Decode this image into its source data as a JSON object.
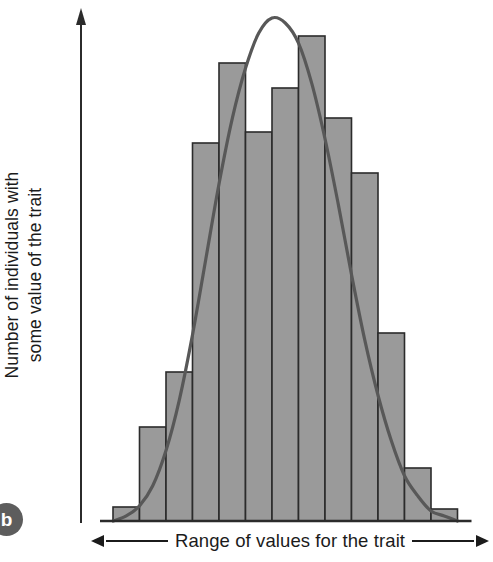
{
  "figure": {
    "panel_label": "b",
    "background_color": "#ffffff",
    "bar_fill_color": "#9a9a9a",
    "bar_stroke_color": "#2b2b2b",
    "curve_color": "#585858",
    "axis_color": "#2b2b2b",
    "text_color": "#1b1b1b"
  },
  "y_axis": {
    "title_lines": [
      "Number of individuals with",
      "some value of the trait"
    ],
    "arrow": "up-arrow-icon"
  },
  "x_axis": {
    "title": "Range of values for the trait",
    "left_arrow": "left-arrow-icon",
    "right_arrow": "right-arrow-icon"
  },
  "chart_data": {
    "type": "bar",
    "title": "",
    "xlabel": "Range of values for the trait",
    "ylabel": "Number of individuals with some value of the trait",
    "grid": false,
    "legend_position": "none",
    "axis_tick_labels": {
      "x": [],
      "y": []
    },
    "xlim": [
      0,
      13
    ],
    "ylim": [
      0,
      100
    ],
    "categories": [
      "1",
      "2",
      "3",
      "4",
      "5",
      "6",
      "7",
      "8",
      "9",
      "10",
      "11",
      "12",
      "13"
    ],
    "values": [
      3,
      19,
      30,
      75,
      91,
      77,
      86,
      96,
      80,
      69,
      37,
      11,
      2
    ],
    "annotations": [
      "Bell-shaped normal distribution curve overlaid on the histogram",
      "Histogram of a continuously varying polygenic trait"
    ],
    "series": [
      {
        "name": "Number of individuals",
        "type": "bar",
        "values": [
          3,
          19,
          30,
          75,
          91,
          77,
          86,
          96,
          80,
          69,
          37,
          11,
          2
        ]
      },
      {
        "name": "Normal distribution curve",
        "type": "line",
        "x": [
          0.0,
          0.5,
          1.0,
          1.5,
          2.0,
          2.5,
          3.0,
          3.5,
          4.0,
          4.5,
          5.0,
          5.5,
          6.0,
          6.5,
          7.0,
          7.5,
          8.0,
          8.5,
          9.0,
          9.5,
          10.0,
          10.5,
          11.0,
          11.5,
          12.0,
          12.5,
          13.0
        ],
        "values": [
          0,
          1,
          3,
          7,
          14,
          24,
          37,
          52,
          67,
          80,
          90,
          97,
          100,
          99,
          95,
          87,
          76,
          63,
          49,
          36,
          25,
          16,
          9,
          5,
          2,
          1,
          0
        ]
      }
    ]
  },
  "geometry": {
    "baseline_y": 513,
    "bar_left_x": 21,
    "bar_width": 26.5,
    "bar_tops_px": [
      499,
      419,
      364,
      135,
      55,
      124,
      80,
      28,
      110,
      165,
      325,
      460,
      501
    ],
    "curve_peak": {
      "x": 193,
      "y": 10
    },
    "curve_left_foot_x": 8,
    "curve_right_foot_x": 378
  }
}
